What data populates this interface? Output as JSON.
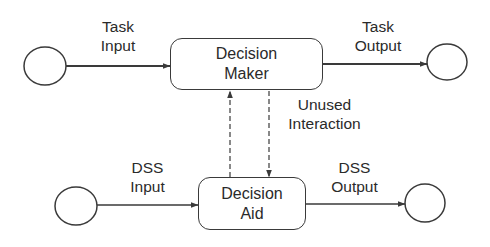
{
  "diagram": {
    "nodes": {
      "decision_maker": {
        "line1": "Decision",
        "line2": "Maker"
      },
      "decision_aid": {
        "line1": "Decision",
        "line2": "Aid"
      }
    },
    "terminals": [
      {
        "id": "task-input-source"
      },
      {
        "id": "task-output-sink"
      },
      {
        "id": "dss-input-source"
      },
      {
        "id": "dss-output-sink"
      }
    ],
    "edges": {
      "task_input": {
        "line1": "Task",
        "line2": "Input",
        "style": "solid"
      },
      "task_output": {
        "line1": "Task",
        "line2": "Output",
        "style": "solid"
      },
      "dss_input": {
        "line1": "DSS",
        "line2": "Input",
        "style": "solid"
      },
      "dss_output": {
        "line1": "DSS",
        "line2": "Output",
        "style": "solid"
      },
      "unused_interaction": {
        "line1": "Unused",
        "line2": "Interaction",
        "style": "dashed"
      }
    },
    "colors": {
      "stroke": "#3a3a3a",
      "text": "#2a2a2a",
      "background": "#ffffff"
    }
  }
}
